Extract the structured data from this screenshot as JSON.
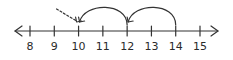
{
  "diagram": {
    "type": "number-line",
    "range": [
      8,
      15
    ],
    "tick_labels": [
      "8",
      "9",
      "10",
      "11",
      "12",
      "13",
      "14",
      "15"
    ],
    "arrows_both_ends": true,
    "hops": [
      {
        "from": 14,
        "to": 12,
        "style": "solid"
      },
      {
        "from": 12,
        "to": 10,
        "style": "solid"
      },
      {
        "from": 9.3,
        "to": 10,
        "style": "dashed",
        "partial": true
      }
    ],
    "colors": {
      "ink": "#333333",
      "background": "#ffffff"
    }
  }
}
